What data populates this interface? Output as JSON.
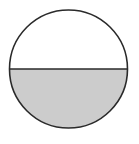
{
  "figure": {
    "canvas": {
      "width": 139,
      "height": 144,
      "background_color": "#FFFFFF"
    },
    "circle": {
      "center_x": 68.5,
      "center_y": 69,
      "radius": 59,
      "stroke_color": "#2A2A2A",
      "stroke_width": 1.6,
      "unshaded_fill_color": "#FFFFFF"
    },
    "chord": {
      "type": "diameter",
      "orientation": "horizontal",
      "y": 69,
      "x_start": 9.5,
      "x_end": 127.5,
      "stroke_color": "#2A2A2A",
      "stroke_width": 1.6
    },
    "shaded_region": {
      "name": "lower-semicircle",
      "fill_color": "#CCCCCC",
      "fraction_of_circle": 0.5
    },
    "unshaded_region": {
      "name": "upper-semicircle",
      "fill_color": "#FFFFFF",
      "fraction_of_circle": 0.5
    },
    "labels": []
  }
}
